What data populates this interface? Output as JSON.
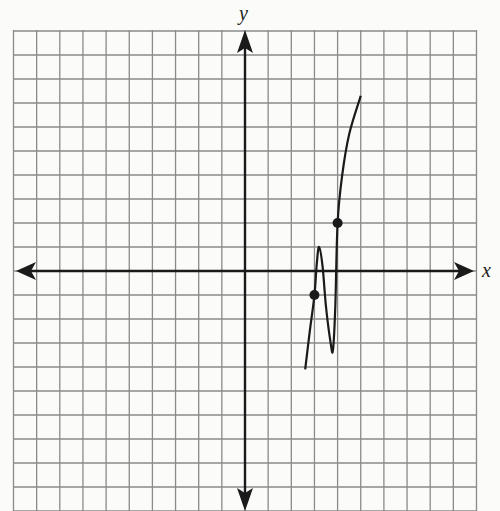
{
  "chart_data": {
    "type": "line",
    "title": "",
    "xlabel": "x",
    "ylabel": "y",
    "grid": true,
    "xlim": [
      -10,
      10
    ],
    "ylim": [
      -10,
      10
    ],
    "grid_unit": 1,
    "tick_labels": false,
    "series": [
      {
        "name": "curve",
        "points": [
          [
            2.6,
            -4.1
          ],
          [
            2.8,
            -2.5
          ],
          [
            3.0,
            -1
          ],
          [
            3.1,
            0.3
          ],
          [
            3.2,
            1
          ],
          [
            3.35,
            0.2
          ],
          [
            3.5,
            -1.5
          ],
          [
            3.7,
            -3.0
          ],
          [
            3.8,
            -3.3
          ],
          [
            3.9,
            -1.5
          ],
          [
            4.0,
            2
          ],
          [
            4.2,
            4.0
          ],
          [
            4.5,
            5.7
          ],
          [
            5.0,
            7.3
          ]
        ]
      }
    ],
    "marked_points": [
      {
        "x": 3,
        "y": -1
      },
      {
        "x": 4,
        "y": 2
      }
    ]
  },
  "labels": {
    "x_axis": "x",
    "y_axis": "y"
  }
}
